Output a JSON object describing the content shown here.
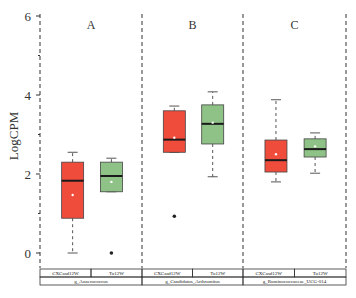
{
  "chart_data": {
    "type": "boxplot",
    "title": "",
    "ylabel": "LogCPM",
    "xlabel": "",
    "ylim": [
      -0.35,
      6
    ],
    "yticks": [
      0,
      2,
      4,
      6
    ],
    "grid": false,
    "panels": [
      {
        "label": "A",
        "genus": "g_Anaerococcus",
        "groups": [
          {
            "name": "CXCasd12W",
            "color": "#f04c3c",
            "whisker_low": 0.0,
            "q1": 0.88,
            "median": 1.83,
            "q3": 2.3,
            "whisker_high": 2.55,
            "mean": 1.47,
            "outliers": []
          },
          {
            "name": "Tu12W",
            "color": "#8fc286",
            "whisker_low": 1.55,
            "q1": 1.55,
            "median": 1.95,
            "q3": 2.3,
            "whisker_high": 2.4,
            "mean": 1.8,
            "outliers": [
              0.0
            ]
          }
        ]
      },
      {
        "label": "B",
        "genus": "g_Candidatus_Arthromitus",
        "groups": [
          {
            "name": "CXCasd12W",
            "color": "#f04c3c",
            "whisker_low": 2.55,
            "q1": 2.55,
            "median": 2.87,
            "q3": 3.6,
            "whisker_high": 3.72,
            "mean": 2.92,
            "outliers": [
              0.93
            ]
          },
          {
            "name": "Tu12W",
            "color": "#8fc286",
            "whisker_low": 1.93,
            "q1": 2.76,
            "median": 3.27,
            "q3": 3.75,
            "whisker_high": 4.08,
            "mean": 3.3,
            "outliers": []
          }
        ]
      },
      {
        "label": "C",
        "genus": "g_Ruminococcaceae_UCG-014",
        "groups": [
          {
            "name": "CXCasd12W",
            "color": "#f04c3c",
            "whisker_low": 1.8,
            "q1": 2.05,
            "median": 2.35,
            "q3": 2.86,
            "whisker_high": 3.88,
            "mean": 2.5,
            "outliers": []
          },
          {
            "name": "Tu12W",
            "color": "#8fc286",
            "whisker_low": 2.02,
            "q1": 2.43,
            "median": 2.63,
            "q3": 2.89,
            "whisker_high": 3.04,
            "mean": 2.7,
            "outliers": []
          }
        ]
      }
    ]
  }
}
